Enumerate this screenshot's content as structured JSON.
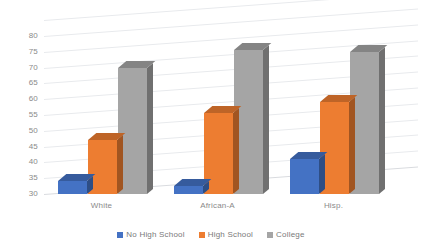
{
  "chart_data": {
    "type": "bar",
    "title": "",
    "subtitle": "",
    "xlabel": "",
    "ylabel": "",
    "categories": [
      "White",
      "African-A",
      "Hisp."
    ],
    "series": [
      {
        "name": "No High School",
        "color": "#4472C4",
        "values": [
          34,
          32.5,
          41
        ]
      },
      {
        "name": "High School",
        "color": "#ED7D31",
        "values": [
          47,
          55.5,
          59
        ]
      },
      {
        "name": "College",
        "color": "#A5A5A5",
        "values": [
          70,
          75.5,
          75
        ]
      }
    ],
    "ylim": [
      30,
      80
    ],
    "ytick_step": 5,
    "yticks": [
      "80",
      "75",
      "70",
      "65",
      "60",
      "55",
      "50",
      "45",
      "40",
      "35",
      "30"
    ],
    "grid": true,
    "legend_position": "bottom",
    "three_d": true
  },
  "legend": {
    "items": [
      {
        "label": "No High School",
        "color": "#4472C4"
      },
      {
        "label": "High School",
        "color": "#ED7D31"
      },
      {
        "label": "College",
        "color": "#A5A5A5"
      }
    ]
  },
  "colors": {
    "series_blue": "#4472C4",
    "series_orange": "#ED7D31",
    "series_gray": "#A5A5A5",
    "gridline": "#E8EAED",
    "tick_text": "#8A8A8A",
    "background": "#FFFFFF"
  }
}
